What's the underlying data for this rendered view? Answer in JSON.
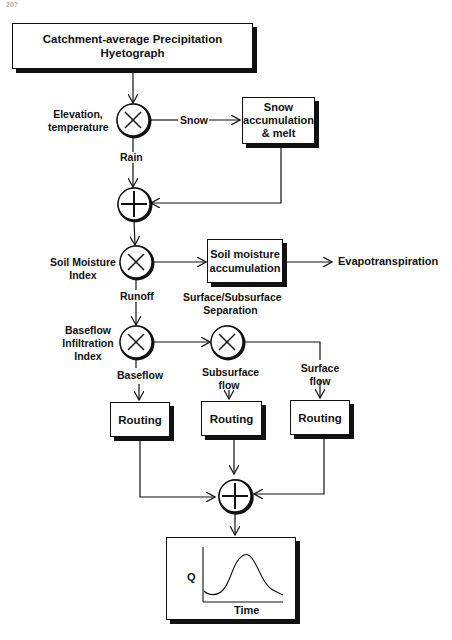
{
  "page": {
    "page_number": "20?"
  },
  "diagram": {
    "title_box": {
      "line1": "Catchment-average Precipitation",
      "line2": "Hyetograph"
    },
    "nodes": {
      "split_snow_rain": {
        "type": "multiply",
        "symbol": "×",
        "label_line1": "Elevation,",
        "label_line2": "temperature"
      },
      "sum_rain_melt": {
        "type": "sum",
        "symbol": "+"
      },
      "split_soil": {
        "type": "multiply",
        "symbol": "×",
        "label_line1": "Soil Moisture",
        "label_line2": "Index"
      },
      "split_baseflow": {
        "type": "multiply",
        "symbol": "×",
        "label_line1": "Baseflow",
        "label_line2": "Infiltration",
        "label_line3": "Index"
      },
      "split_surface": {
        "type": "multiply",
        "symbol": "×",
        "label_line1": "Surface/Subsurface",
        "label_line2": "Separation"
      },
      "sum_routing": {
        "type": "sum",
        "symbol": "+"
      }
    },
    "boxes": {
      "snow": {
        "line1": "Snow",
        "line2": "accumulation",
        "line3": "& melt"
      },
      "soil": {
        "line1": "Soil moisture",
        "line2": "accumulation"
      },
      "routing_1": {
        "label": "Routing"
      },
      "routing_2": {
        "label": "Routing"
      },
      "routing_3": {
        "label": "Routing"
      }
    },
    "edges": {
      "snow": "Snow",
      "rain": "Rain",
      "runoff": "Runoff",
      "evapotranspiration": "Evapotranspiration",
      "baseflow": "Baseflow",
      "subsurface_line1": "Subsurface",
      "subsurface_line2": "flow",
      "surface_line1": "Surface",
      "surface_line2": "flow"
    },
    "hydrograph": {
      "ylabel": "Q",
      "xlabel": "Time"
    }
  }
}
